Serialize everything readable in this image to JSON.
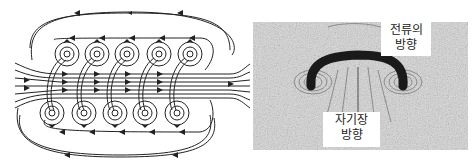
{
  "figure": {
    "left_panel": {
      "type": "solenoid-field-line-diagram",
      "top_coil_count": 5,
      "bottom_coil_count": 5,
      "line_color": "#222222"
    },
    "right_panel": {
      "type": "iron-filings-photo",
      "labels": {
        "current_direction": {
          "line1": "전류의",
          "line2": "방향"
        },
        "field_direction": {
          "line1": "자기장",
          "line2": "방향"
        }
      },
      "background_color": "#cfcfcf",
      "wire_color": "#1a1a1a"
    }
  }
}
